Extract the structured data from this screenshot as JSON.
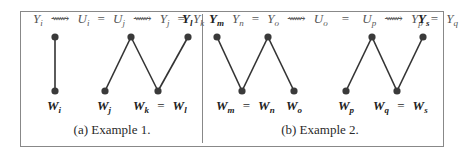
{
  "figure": {
    "panels": [
      {
        "id": "a",
        "caption": "(a) Example 1.",
        "top_label": {
          "chain": [
            {
              "base": "Y",
              "sub": "i"
            },
            {
              "op": "⟿"
            },
            {
              "base": "U",
              "sub": "i"
            },
            {
              "op": "="
            },
            {
              "base": "U",
              "sub": "j"
            },
            {
              "op": "⟿"
            },
            {
              "base": "Y",
              "sub": "j"
            },
            {
              "op": "="
            },
            {
              "base": "Y",
              "sub": "k"
            }
          ],
          "bold_end": {
            "base": "Y",
            "sub": "l"
          }
        },
        "top_nodes": [
          {
            "x": 55,
            "y": 37
          },
          {
            "x": 131,
            "y": 37
          },
          {
            "x": 188,
            "y": 37
          }
        ],
        "bottom_nodes": [
          {
            "x": 55,
            "y": 91,
            "label": {
              "base": "W",
              "sub": "i",
              "bold": true
            }
          },
          {
            "x": 105,
            "y": 91,
            "label": {
              "base": "W",
              "sub": "j",
              "bold": true
            }
          },
          {
            "x": 158,
            "y": 91,
            "label": {
              "text": "W_k = W_l",
              "bold": true
            }
          }
        ],
        "bottom_labels": [
          "W_i",
          "W_j",
          "W_k = W_l"
        ]
      },
      {
        "id": "b",
        "caption": "(b) Example 2.",
        "top_label": {
          "bold_start": {
            "base": "Y",
            "sub": "m"
          },
          "chain": [
            {
              "base": "Y",
              "sub": "n"
            },
            {
              "op": "="
            },
            {
              "base": "Y",
              "sub": "o"
            },
            {
              "op": "⟿"
            },
            {
              "base": "U",
              "sub": "o"
            },
            {
              "op": "="
            },
            {
              "base": "U",
              "sub": "p"
            },
            {
              "op": "⟿"
            },
            {
              "base": "Y",
              "sub": "p"
            },
            {
              "op": "="
            },
            {
              "base": "Y",
              "sub": "q"
            }
          ],
          "bold_end": {
            "base": "Y",
            "sub": "s"
          }
        },
        "top_nodes": [
          {
            "x": 217,
            "y": 37
          },
          {
            "x": 268,
            "y": 37
          },
          {
            "x": 372,
            "y": 37
          },
          {
            "x": 423,
            "y": 37
          }
        ],
        "bottom_nodes": [
          {
            "x": 242,
            "y": 91
          },
          {
            "x": 294,
            "y": 91
          },
          {
            "x": 346,
            "y": 91
          },
          {
            "x": 397,
            "y": 91
          }
        ],
        "bottom_labels": [
          "W_m = W_n",
          "W_o",
          "W_p",
          "W_q = W_s"
        ]
      }
    ],
    "text": {
      "a_top": {
        "Yi": "Y",
        "Yi_s": "i",
        "sq1": "⟿",
        "Ui": "U",
        "Ui_s": "i",
        "eq1": "=",
        "Uj": "U",
        "Uj_s": "j",
        "sq2": "⟿",
        "Yj": "Y",
        "Yj_s": "j",
        "eq2": "=",
        "Yk": "Y",
        "Yk_s": "k",
        "Yl": "Y",
        "Yl_s": "l"
      },
      "a_bot": {
        "Wi": "W",
        "Wi_s": "i",
        "Wj": "W",
        "Wj_s": "j",
        "Wk": "W",
        "Wk_s": "k",
        "eq": "=",
        "Wl": "W",
        "Wl_s": "l"
      },
      "b_top": {
        "Ym": "Y",
        "Ym_s": "m",
        "Yn": "Y",
        "Yn_s": "n",
        "eq1": "=",
        "Yo": "Y",
        "Yo_s": "o",
        "sq1": "⟿",
        "Uo": "U",
        "Uo_s": "o",
        "eq2": "=",
        "Up": "U",
        "Up_s": "p",
        "sq2": "⟿",
        "Yp": "Y",
        "Yp_s": "p",
        "eq3": "=",
        "Yq": "Y",
        "Yq_s": "q",
        "Ys": "Y",
        "Ys_s": "s"
      },
      "b_bot": {
        "Wm": "W",
        "Wm_s": "m",
        "eq1": "=",
        "Wn": "W",
        "Wn_s": "n",
        "Wo": "W",
        "Wo_s": "o",
        "Wp": "W",
        "Wp_s": "p",
        "Wq": "W",
        "Wq_s": "q",
        "eq2": "=",
        "Ws": "W",
        "Ws_s": "s"
      },
      "caption_a": "(a) Example 1.",
      "caption_b": "(b) Example 2."
    },
    "colors": {
      "node": "#3a3a3a",
      "edge": "#333333",
      "border": "#888888",
      "top_text": "#555555"
    }
  }
}
